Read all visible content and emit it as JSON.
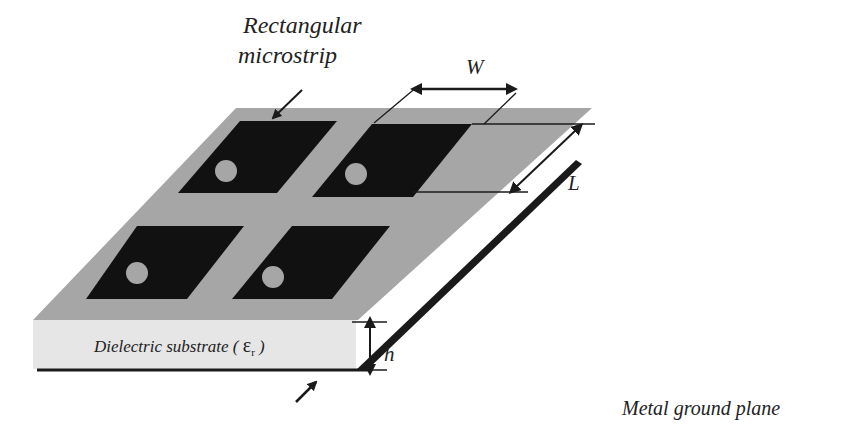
{
  "diagram": {
    "type": "microstrip-patch-antenna-array",
    "labels": {
      "patch_title_line1": "Rectangular",
      "patch_title_line2": "microstrip",
      "width_symbol": "W",
      "length_symbol": "L",
      "height_symbol": "h",
      "substrate_label": "Dielectric substrate ( ",
      "epsilon_symbol": "ε",
      "epsilon_subscript": "r",
      "substrate_close": " )",
      "ground_label": "Metal ground plane"
    },
    "patch_count": 4,
    "colors": {
      "substrate_top": "#a6a6a6",
      "substrate_front": "#e6e6e6",
      "patch": "#111111",
      "feed_point": "#a6a6a6",
      "ground": "#1a1a1a",
      "lines": "#1a1a1a"
    }
  }
}
